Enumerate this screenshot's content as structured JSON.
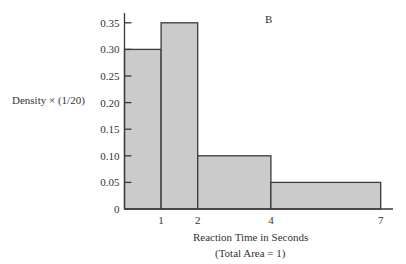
{
  "chart_data": {
    "type": "bar",
    "subtype": "histogram",
    "panel_label": "B",
    "title": "",
    "xlabel": "Reaction Time in Seconds",
    "xlabel_note": "(Total Area = 1)",
    "ylabel": "Density × (1/20)",
    "bins": [
      {
        "from": 0,
        "to": 1,
        "value": 0.3
      },
      {
        "from": 1,
        "to": 2,
        "value": 0.35
      },
      {
        "from": 2,
        "to": 4,
        "value": 0.1
      },
      {
        "from": 4,
        "to": 7,
        "value": 0.05
      }
    ],
    "categories": [
      "0-1",
      "1-2",
      "2-4",
      "4-7"
    ],
    "values": [
      0.3,
      0.35,
      0.1,
      0.05
    ],
    "x_ticks": [
      1,
      2,
      4,
      7
    ],
    "y_ticks": [
      0,
      0.05,
      0.1,
      0.15,
      0.2,
      0.25,
      0.3,
      0.35
    ],
    "y_tick_labels": [
      "0",
      "0.05",
      "0.10",
      "0.15",
      "0.20",
      "0.25",
      "0.30",
      "0.35"
    ],
    "xlim": [
      0,
      7.3
    ],
    "ylim": [
      0,
      0.37
    ],
    "grid": false,
    "legend": null,
    "colors": {
      "bar_fill": "#cbcbcb",
      "bar_edge": "#3a3a3a",
      "axis": "#3a3a3a"
    }
  }
}
